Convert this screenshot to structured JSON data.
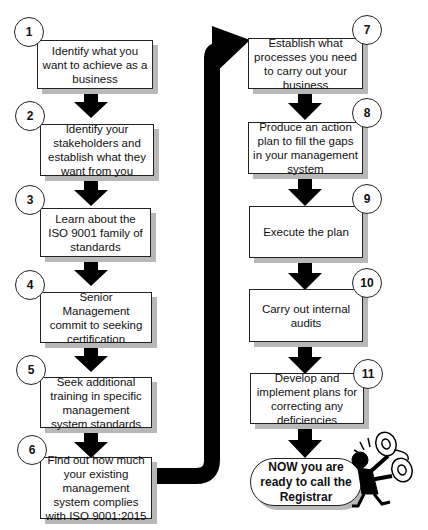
{
  "diagram": {
    "type": "flowchart",
    "left_column": [
      {
        "number": "1",
        "text": "Identify what you want to achieve as a business"
      },
      {
        "number": "2",
        "text": "Identify your stakeholders and establish what they want from you"
      },
      {
        "number": "3",
        "text": "Learn about the ISO 9001 family of standards"
      },
      {
        "number": "4",
        "text": "Senior Management commit to seeking certification"
      },
      {
        "number": "5",
        "text": "Seek additional training in specific management system standards"
      },
      {
        "number": "6",
        "text": "Find out how much your existing management system complies with ISO 9001:2015"
      }
    ],
    "right_column": [
      {
        "number": "7",
        "text": "Establish what processes you need to carry out your business"
      },
      {
        "number": "8",
        "text": "Produce an action plan to fill the gaps in your management system"
      },
      {
        "number": "9",
        "text": "Execute the plan"
      },
      {
        "number": "10",
        "text": "Carry out internal audits"
      },
      {
        "number": "11",
        "text": "Develop and implement plans for correcting any deficiencies"
      }
    ],
    "final": {
      "text": "NOW you are ready to call the Registrar"
    },
    "illustration": "person-with-telephone",
    "colors": {
      "arrow": "#000000",
      "shadow": "#b8b8b8",
      "border": "#222222"
    }
  }
}
